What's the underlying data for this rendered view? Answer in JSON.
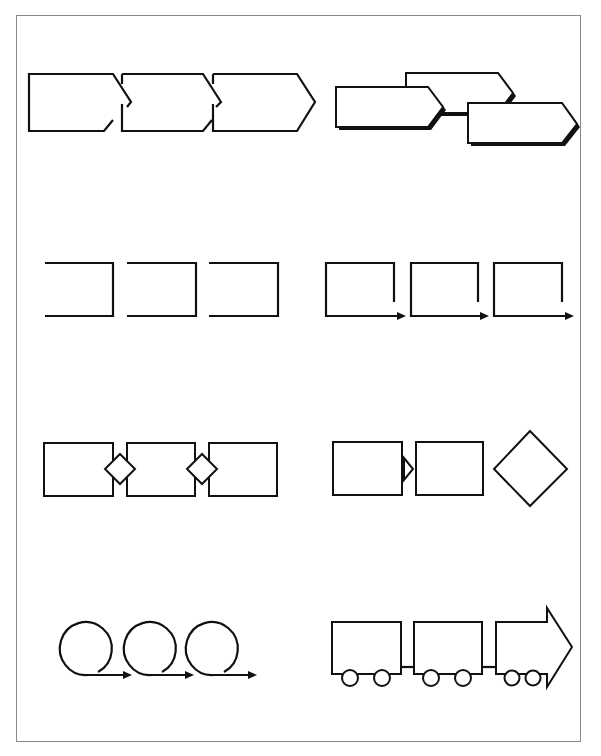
{
  "page": {
    "frame_color": "#8a8a8a",
    "stroke_color": "#111111",
    "background": "#ffffff"
  },
  "diagrams": [
    {
      "id": "interlocking-chevrons",
      "row": 1,
      "column": "left",
      "shape": "chevron",
      "count": 3
    },
    {
      "id": "staggered-shadow-chevrons",
      "row": 1,
      "column": "right",
      "shape": "chevron-with-shadow",
      "count": 3
    },
    {
      "id": "open-brackets",
      "row": 2,
      "column": "left",
      "shape": "open-bracket",
      "count": 3
    },
    {
      "id": "bracket-arrows",
      "row": 2,
      "column": "right",
      "shape": "bracket-with-arrow",
      "count": 3
    },
    {
      "id": "boxes-with-diamond-connectors",
      "row": 3,
      "column": "left",
      "shape": "rectangle-diamond",
      "count": 3
    },
    {
      "id": "boxes-triangle-diamond",
      "row": 3,
      "column": "right",
      "shape": "rectangle-triangle-diamond",
      "count": 3
    },
    {
      "id": "loop-arrows",
      "row": 4,
      "column": "left",
      "shape": "loop-arrow",
      "count": 3
    },
    {
      "id": "train-arrow",
      "row": 4,
      "column": "right",
      "shape": "train-cars-arrow",
      "count": 3
    }
  ]
}
